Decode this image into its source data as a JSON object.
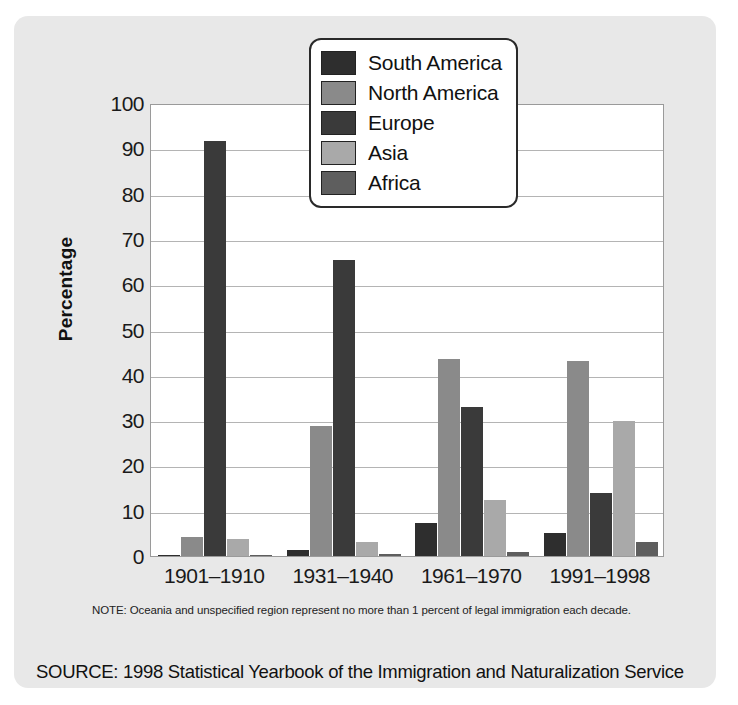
{
  "chart_data": {
    "type": "bar",
    "title": "",
    "xlabel": "",
    "ylabel": "Percentage",
    "ylim": [
      0,
      100
    ],
    "ytick_step": 10,
    "yticks": [
      "0",
      "10",
      "20",
      "30",
      "40",
      "50",
      "60",
      "70",
      "80",
      "90",
      "100"
    ],
    "grid": true,
    "legend_position": "top-right-inside",
    "categories": [
      "1901–1910",
      "1931–1940",
      "1961–1970",
      "1991–1998"
    ],
    "series": [
      {
        "name": "South America",
        "color": "#2e2e2e",
        "values": [
          0.2,
          1.3,
          7.2,
          5.1
        ]
      },
      {
        "name": "North America",
        "color": "#8a8a8a",
        "values": [
          4.1,
          28.6,
          43.4,
          43.0
        ]
      },
      {
        "name": "Europe",
        "color": "#3a3a3a",
        "values": [
          91.6,
          65.4,
          33.0,
          14.0
        ]
      },
      {
        "name": "Asia",
        "color": "#a9a9a9",
        "values": [
          3.7,
          3.0,
          12.4,
          29.9
        ]
      },
      {
        "name": "Africa",
        "color": "#5e5e5e",
        "values": [
          0.2,
          0.4,
          0.8,
          3.0
        ]
      }
    ],
    "note": "NOTE: Oceania and unspecified region represent no more than 1 percent of legal immigration each decade.",
    "source": "SOURCE: 1998 Statistical Yearbook of the Immigration and Naturalization Service"
  },
  "colors": {
    "panel_background": "#e8e8e8",
    "plot_background": "#ffffff",
    "gridline": "#b4b4b4",
    "axis": "#9a9a9a",
    "text": "#111111"
  }
}
